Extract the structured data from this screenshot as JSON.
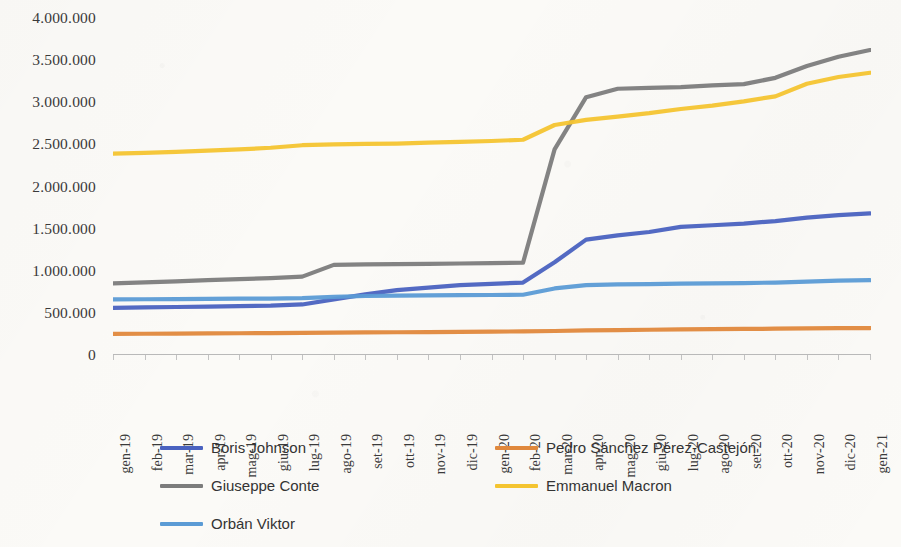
{
  "chart_data": {
    "type": "line",
    "title": "",
    "subtitle": "",
    "xlabel": "",
    "ylabel": "",
    "ylim": [
      0,
      4000000
    ],
    "ytick_step": 500000,
    "ytick_labels": [
      "4.000.000",
      "3.500.000",
      "3.000.000",
      "2.500.000",
      "2.000.000",
      "1.500.000",
      "1.000.000",
      "500.000",
      "0"
    ],
    "ytick_values": [
      4000000,
      3500000,
      3000000,
      2500000,
      2000000,
      1500000,
      1000000,
      500000,
      0
    ],
    "grid": false,
    "legend_position": "bottom",
    "legend_columns": 2,
    "categories": [
      "gen-19",
      "feb-19",
      "mar-19",
      "apr-19",
      "mag-19",
      "giu-19",
      "lug-19",
      "ago-19",
      "set-19",
      "ott-19",
      "nov-19",
      "dic-19",
      "gen-20",
      "feb-20",
      "mar-20",
      "apr-20",
      "mag-20",
      "giu-20",
      "lug-20",
      "ago-20",
      "set-20",
      "ott-20",
      "nov-20",
      "dic-20",
      "gen-21"
    ],
    "series": [
      {
        "name": "Boris Johnson",
        "color": "#4a62c0",
        "values": [
          560000,
          565000,
          570000,
          575000,
          580000,
          585000,
          600000,
          660000,
          720000,
          770000,
          800000,
          830000,
          845000,
          860000,
          1100000,
          1370000,
          1420000,
          1460000,
          1520000,
          1540000,
          1560000,
          1590000,
          1630000,
          1660000,
          1680000
        ]
      },
      {
        "name": "Pedro Sánchez Pérez-Castejón",
        "color": "#e0883c",
        "values": [
          250000,
          252000,
          254000,
          256000,
          258000,
          260000,
          262000,
          265000,
          268000,
          270000,
          272000,
          275000,
          278000,
          280000,
          285000,
          292000,
          296000,
          300000,
          303000,
          306000,
          309000,
          312000,
          315000,
          318000,
          320000
        ]
      },
      {
        "name": "Giuseppe Conte",
        "color": "#7c7c7c",
        "values": [
          850000,
          862000,
          875000,
          888000,
          900000,
          912000,
          930000,
          1070000,
          1075000,
          1078000,
          1082000,
          1086000,
          1090000,
          1095000,
          2440000,
          3060000,
          3160000,
          3170000,
          3180000,
          3200000,
          3215000,
          3290000,
          3430000,
          3540000,
          3620000
        ]
      },
      {
        "name": "Emmanuel Macron",
        "color": "#f4c430",
        "values": [
          2390000,
          2400000,
          2410000,
          2425000,
          2440000,
          2460000,
          2490000,
          2500000,
          2505000,
          2510000,
          2520000,
          2530000,
          2540000,
          2555000,
          2730000,
          2790000,
          2830000,
          2870000,
          2920000,
          2960000,
          3010000,
          3070000,
          3220000,
          3300000,
          3350000
        ]
      },
      {
        "name": "Orbán Viktor",
        "color": "#5b9bd5",
        "values": [
          660000,
          662000,
          664000,
          666000,
          668000,
          670000,
          675000,
          690000,
          700000,
          705000,
          708000,
          710000,
          712000,
          715000,
          790000,
          830000,
          838000,
          842000,
          846000,
          850000,
          854000,
          860000,
          872000,
          882000,
          888000
        ]
      }
    ]
  }
}
